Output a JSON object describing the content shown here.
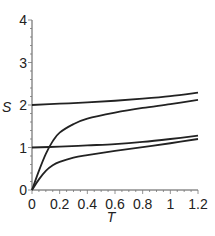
{
  "chart_data": {
    "type": "line",
    "title": "",
    "xlabel": "T",
    "ylabel": "S",
    "xlim": [
      0,
      1.2
    ],
    "ylim": [
      0,
      4
    ],
    "grid": false,
    "legend": null,
    "x_ticks": [
      "0",
      "0.2",
      "0.4",
      "0.6",
      "0.8",
      "1",
      "1.2"
    ],
    "y_ticks": [
      "0",
      "1",
      "2",
      "3",
      "4"
    ],
    "series": [
      {
        "name": "curve-1",
        "x": [
          0,
          0.2,
          0.4,
          0.6,
          0.8,
          1.0,
          1.2
        ],
        "values": [
          2.0,
          2.03,
          2.06,
          2.1,
          2.15,
          2.21,
          2.29
        ]
      },
      {
        "name": "curve-2",
        "x": [
          0,
          0.05,
          0.1,
          0.15,
          0.2,
          0.3,
          0.4,
          0.6,
          0.8,
          1.0,
          1.2
        ],
        "values": [
          0,
          0.45,
          0.85,
          1.15,
          1.35,
          1.55,
          1.68,
          1.82,
          1.93,
          2.02,
          2.12
        ]
      },
      {
        "name": "curve-3",
        "x": [
          0,
          0.2,
          0.4,
          0.6,
          0.8,
          1.0,
          1.2
        ],
        "values": [
          1.0,
          1.02,
          1.05,
          1.08,
          1.13,
          1.2,
          1.28
        ]
      },
      {
        "name": "curve-4",
        "x": [
          0,
          0.05,
          0.1,
          0.15,
          0.2,
          0.3,
          0.4,
          0.6,
          0.8,
          1.0,
          1.2
        ],
        "values": [
          0,
          0.25,
          0.45,
          0.58,
          0.66,
          0.76,
          0.82,
          0.92,
          1.01,
          1.1,
          1.2
        ]
      }
    ]
  }
}
